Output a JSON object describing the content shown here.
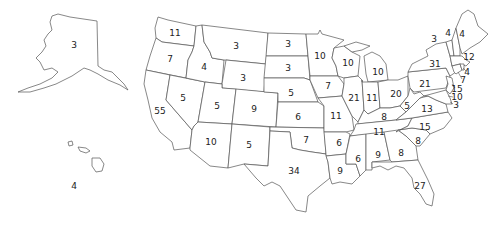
{
  "map": {
    "title": "United States electoral votes by state",
    "line_color": "#555555",
    "fill_color": "#ffffff",
    "text_color": "#222222",
    "states": [
      {
        "id": "AK",
        "votes": "3",
        "x": 74,
        "y": 45
      },
      {
        "id": "HI",
        "votes": "4",
        "x": 74,
        "y": 186
      },
      {
        "id": "WA",
        "votes": "11",
        "x": 175,
        "y": 33
      },
      {
        "id": "OR",
        "votes": "7",
        "x": 170,
        "y": 59
      },
      {
        "id": "ID",
        "votes": "4",
        "x": 204,
        "y": 67
      },
      {
        "id": "CA",
        "votes": "55",
        "x": 160,
        "y": 111
      },
      {
        "id": "NV",
        "votes": "5",
        "x": 183,
        "y": 98
      },
      {
        "id": "MT",
        "votes": "3",
        "x": 236,
        "y": 46
      },
      {
        "id": "WY",
        "votes": "3",
        "x": 243,
        "y": 78
      },
      {
        "id": "UT",
        "votes": "5",
        "x": 217,
        "y": 106
      },
      {
        "id": "CO",
        "votes": "9",
        "x": 254,
        "y": 109
      },
      {
        "id": "AZ",
        "votes": "10",
        "x": 211,
        "y": 142
      },
      {
        "id": "NM",
        "votes": "5",
        "x": 249,
        "y": 145
      },
      {
        "id": "ND",
        "votes": "3",
        "x": 288,
        "y": 44
      },
      {
        "id": "SD",
        "votes": "3",
        "x": 288,
        "y": 68
      },
      {
        "id": "NE",
        "votes": "5",
        "x": 291,
        "y": 93
      },
      {
        "id": "KS",
        "votes": "6",
        "x": 298,
        "y": 117
      },
      {
        "id": "OK",
        "votes": "7",
        "x": 306,
        "y": 140
      },
      {
        "id": "TX",
        "votes": "34",
        "x": 294,
        "y": 171
      },
      {
        "id": "MN",
        "votes": "10",
        "x": 320,
        "y": 56
      },
      {
        "id": "IA",
        "votes": "7",
        "x": 328,
        "y": 86
      },
      {
        "id": "MO",
        "votes": "11",
        "x": 336,
        "y": 116
      },
      {
        "id": "AR",
        "votes": "6",
        "x": 339,
        "y": 143
      },
      {
        "id": "LA",
        "votes": "9",
        "x": 340,
        "y": 171
      },
      {
        "id": "WI",
        "votes": "10",
        "x": 348,
        "y": 63
      },
      {
        "id": "IL",
        "votes": "21",
        "x": 354,
        "y": 98
      },
      {
        "id": "MI",
        "votes": "10",
        "x": 378,
        "y": 72
      },
      {
        "id": "IN",
        "votes": "11",
        "x": 372,
        "y": 98
      },
      {
        "id": "OH",
        "votes": "20",
        "x": 396,
        "y": 94
      },
      {
        "id": "KY",
        "votes": "8",
        "x": 384,
        "y": 117
      },
      {
        "id": "TN",
        "votes": "11",
        "x": 379,
        "y": 132
      },
      {
        "id": "MS",
        "votes": "6",
        "x": 358,
        "y": 159
      },
      {
        "id": "AL",
        "votes": "9",
        "x": 378,
        "y": 155
      },
      {
        "id": "GA",
        "votes": "8",
        "x": 401,
        "y": 153
      },
      {
        "id": "FL",
        "votes": "27",
        "x": 420,
        "y": 186
      },
      {
        "id": "SC",
        "votes": "8",
        "x": 418,
        "y": 141
      },
      {
        "id": "NC",
        "votes": "15",
        "x": 425,
        "y": 127
      },
      {
        "id": "VA",
        "votes": "13",
        "x": 427,
        "y": 109
      },
      {
        "id": "WV",
        "votes": "5",
        "x": 407,
        "y": 106
      },
      {
        "id": "PA",
        "votes": "21",
        "x": 425,
        "y": 84
      },
      {
        "id": "NY",
        "votes": "31",
        "x": 435,
        "y": 64
      },
      {
        "id": "VT",
        "votes": "3",
        "x": 434,
        "y": 39
      },
      {
        "id": "NH",
        "votes": "4",
        "x": 448,
        "y": 33
      },
      {
        "id": "ME",
        "votes": "4",
        "x": 462,
        "y": 34
      },
      {
        "id": "MA",
        "votes": "12",
        "x": 469,
        "y": 57
      },
      {
        "id": "RI",
        "votes": "4",
        "x": 467,
        "y": 72
      },
      {
        "id": "CT",
        "votes": "7",
        "x": 463,
        "y": 80
      },
      {
        "id": "NJ",
        "votes": "15",
        "x": 457,
        "y": 89
      },
      {
        "id": "DE",
        "votes": "3",
        "x": 456,
        "y": 105
      },
      {
        "id": "MD",
        "votes": "10",
        "x": 457,
        "y": 97
      },
      {
        "id": "DC",
        "votes": "3",
        "x": 456,
        "y": 105
      }
    ]
  },
  "chart_data": {
    "type": "map",
    "title": "",
    "categories": [
      "AK",
      "HI",
      "WA",
      "OR",
      "ID",
      "CA",
      "NV",
      "MT",
      "WY",
      "UT",
      "CO",
      "AZ",
      "NM",
      "ND",
      "SD",
      "NE",
      "KS",
      "OK",
      "TX",
      "MN",
      "IA",
      "MO",
      "AR",
      "LA",
      "WI",
      "IL",
      "MI",
      "IN",
      "OH",
      "KY",
      "TN",
      "MS",
      "AL",
      "GA",
      "FL",
      "SC",
      "NC",
      "VA",
      "WV",
      "PA",
      "NY",
      "VT",
      "NH",
      "ME",
      "MA",
      "RI",
      "CT",
      "NJ",
      "MD",
      "DE"
    ],
    "values": [
      3,
      4,
      11,
      7,
      4,
      55,
      5,
      3,
      3,
      5,
      9,
      10,
      5,
      3,
      3,
      5,
      6,
      7,
      34,
      10,
      7,
      11,
      6,
      9,
      10,
      21,
      10,
      11,
      20,
      8,
      11,
      6,
      9,
      8,
      27,
      8,
      15,
      13,
      5,
      21,
      31,
      3,
      4,
      4,
      12,
      4,
      7,
      15,
      10,
      3
    ]
  }
}
